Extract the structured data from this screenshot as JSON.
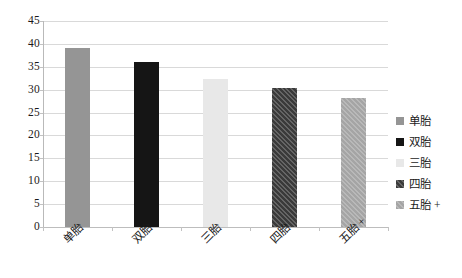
{
  "chart_data": {
    "type": "bar",
    "title": "",
    "subtitle": "",
    "xlabel": "",
    "ylabel": "",
    "categories": [
      "单胎",
      "双胎",
      "三胎",
      "四胎",
      "五胎 +"
    ],
    "values": [
      39.0,
      36.1,
      32.3,
      30.3,
      28.2
    ],
    "series": [
      {
        "name": "",
        "values": [
          39.0,
          36.1,
          32.3,
          30.3,
          28.2
        ]
      }
    ],
    "ylim": [
      0,
      45
    ],
    "ytick_step": 5,
    "ytick_labels": [
      "45",
      "40",
      "35",
      "30",
      "25",
      "20",
      "15",
      "10",
      "5",
      "0"
    ],
    "grid": true,
    "legend_position": "right",
    "bar_styles": [
      {
        "fill": "#959595",
        "hatch": "none"
      },
      {
        "fill": "#151515",
        "hatch": "none"
      },
      {
        "fill": "#e8e8e8",
        "hatch": "none"
      },
      {
        "fill": "#3a3a3a",
        "hatch": "diagonal"
      },
      {
        "fill": "#a5a5a5",
        "hatch": "diagonal"
      }
    ]
  },
  "legend": {
    "items": [
      {
        "label": "单胎",
        "color": "#959595"
      },
      {
        "label": "双胎",
        "color": "#151515"
      },
      {
        "label": "三胎",
        "color": "#e8e8e8"
      },
      {
        "label": "四胎",
        "color": "#3a3a3a"
      },
      {
        "label": "五胎 +",
        "color": "#a5a5a5"
      }
    ]
  },
  "colors": {
    "background": "#ffffff",
    "gridline": "#d9d9d9",
    "axis": "#b9b9b9",
    "text": "#1a1a1a"
  }
}
